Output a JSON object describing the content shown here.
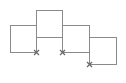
{
  "diagram": {
    "type": "staggered-squares",
    "stroke_color": "#8a8a8a",
    "marker_color": "#6a6a6a",
    "squares": [
      {
        "id": "square-1",
        "x": 10,
        "y": 25,
        "w": 26,
        "h": 27
      },
      {
        "id": "square-2",
        "x": 36,
        "y": 10,
        "w": 26,
        "h": 27
      },
      {
        "id": "square-3",
        "x": 62,
        "y": 25,
        "w": 27,
        "h": 27
      },
      {
        "id": "square-4",
        "x": 89,
        "y": 37,
        "w": 27,
        "h": 27
      }
    ],
    "markers": [
      {
        "id": "marker-1",
        "glyph": "x",
        "x": 36,
        "y": 52
      },
      {
        "id": "marker-2",
        "glyph": "x",
        "x": 62,
        "y": 52
      },
      {
        "id": "marker-3",
        "glyph": "x",
        "x": 89,
        "y": 64
      }
    ]
  }
}
